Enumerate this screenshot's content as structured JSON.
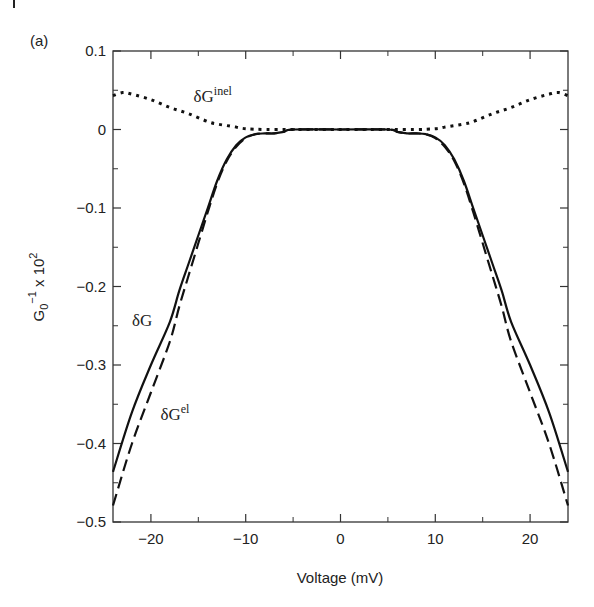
{
  "figure": {
    "panel_label": "(a)"
  },
  "chart_data": {
    "type": "line",
    "title": "",
    "xlabel": "Voltage (mV)",
    "ylabel": "G0^-1 x 10^2",
    "xlim": [
      -24,
      24
    ],
    "ylim": [
      -0.5,
      0.1
    ],
    "xticks": [
      -20,
      -10,
      0,
      10,
      20
    ],
    "xtick_labels": [
      "−20",
      "−10",
      "0",
      "10",
      "20"
    ],
    "yticks": [
      0.1,
      0,
      -0.1,
      -0.2,
      -0.3,
      -0.4,
      -0.5
    ],
    "ytick_labels": [
      "0.1",
      "0",
      "−0.1",
      "−0.2",
      "−0.3",
      "−0.4",
      "−0.5"
    ],
    "grid": false,
    "legend": "inline labels",
    "series": [
      {
        "name": "δG",
        "style": "solid",
        "x": [
          -24,
          -22,
          -20,
          -18,
          -17,
          -16,
          -15,
          -14,
          -13,
          -12,
          -11,
          -10,
          -9,
          -8,
          -7,
          -6,
          -5,
          0,
          5,
          6,
          7,
          8,
          9,
          10,
          11,
          12,
          13,
          14,
          15,
          16,
          17,
          18,
          20,
          22,
          24
        ],
        "y": [
          -0.436,
          -0.36,
          -0.3,
          -0.245,
          -0.205,
          -0.17,
          -0.135,
          -0.1,
          -0.065,
          -0.038,
          -0.02,
          -0.01,
          -0.006,
          -0.005,
          -0.005,
          -0.003,
          0,
          0,
          0,
          -0.003,
          -0.005,
          -0.005,
          -0.006,
          -0.01,
          -0.02,
          -0.038,
          -0.065,
          -0.1,
          -0.135,
          -0.17,
          -0.205,
          -0.245,
          -0.3,
          -0.36,
          -0.436
        ]
      },
      {
        "name": "δG^el",
        "style": "dashed",
        "x": [
          -24,
          -22,
          -20,
          -18,
          -17,
          -16,
          -15,
          -14,
          -13,
          -12,
          -11,
          -10,
          -9,
          -8,
          -7,
          -6,
          -5,
          0,
          5,
          6,
          7,
          8,
          9,
          10,
          11,
          12,
          13,
          14,
          15,
          16,
          17,
          18,
          20,
          22,
          24
        ],
        "y": [
          -0.479,
          -0.4,
          -0.335,
          -0.27,
          -0.225,
          -0.185,
          -0.145,
          -0.105,
          -0.068,
          -0.04,
          -0.022,
          -0.011,
          -0.006,
          -0.005,
          -0.005,
          -0.003,
          0,
          0,
          0,
          -0.003,
          -0.005,
          -0.005,
          -0.006,
          -0.011,
          -0.022,
          -0.04,
          -0.068,
          -0.105,
          -0.145,
          -0.185,
          -0.225,
          -0.27,
          -0.335,
          -0.4,
          -0.479
        ]
      },
      {
        "name": "δG^inel",
        "style": "dotted",
        "x": [
          -24,
          -23,
          -22,
          -20,
          -18,
          -16,
          -14,
          -13,
          -12,
          -11,
          -10,
          -8,
          -5,
          0,
          5,
          8,
          10,
          11,
          12,
          13,
          14,
          16,
          18,
          20,
          22,
          23,
          24
        ],
        "y": [
          0.043,
          0.047,
          0.045,
          0.038,
          0.028,
          0.02,
          0.01,
          0.007,
          0.005,
          0.003,
          0.001,
          0,
          0,
          0,
          0,
          0,
          0.001,
          0.003,
          0.005,
          0.007,
          0.01,
          0.02,
          0.028,
          0.038,
          0.045,
          0.047,
          0.043
        ]
      }
    ],
    "annotations": [
      {
        "text": "δG",
        "sup": "inel",
        "x": -15.5,
        "y": 0.035
      },
      {
        "text": "δG",
        "sup": "",
        "x": -22,
        "y": -0.25
      },
      {
        "text": "δG",
        "sup": "el",
        "x": -19,
        "y": -0.37
      }
    ]
  }
}
